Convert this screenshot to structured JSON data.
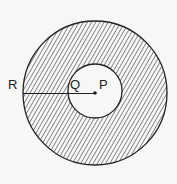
{
  "diagram": {
    "labels": {
      "R": "R",
      "Q": "Q",
      "P": "P"
    },
    "colors": {
      "background": "#f7f7f5",
      "stroke": "#222222",
      "hatch": "#333333"
    }
  }
}
